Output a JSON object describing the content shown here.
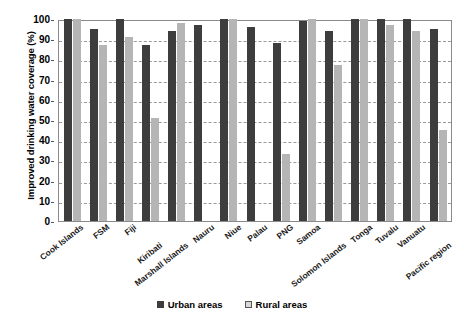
{
  "chart_data": {
    "type": "bar",
    "title": "",
    "xlabel": "",
    "ylabel": "Improved drinking water coverage (%)",
    "ylim": [
      0,
      100
    ],
    "yticks": [
      0,
      10,
      20,
      30,
      40,
      50,
      60,
      70,
      80,
      90,
      100
    ],
    "grid": true,
    "legend_position": "bottom",
    "categories": [
      "Cook Islands",
      "FSM",
      "Fiji",
      "Kiribati",
      "Marshall Islands",
      "Nauru",
      "Niue",
      "Palau",
      "PNG",
      "Samoa",
      "Solomon Islands",
      "Tonga",
      "Tuvalu",
      "Vanuatu",
      "Pacific region"
    ],
    "series": [
      {
        "name": "Urban areas",
        "color": "#3d3d3d",
        "values": [
          100,
          95,
          100,
          87,
          94,
          97,
          100,
          96,
          88,
          99,
          94,
          100,
          100,
          100,
          95
        ]
      },
      {
        "name": "Rural areas",
        "color": "#b5b5b5",
        "values": [
          100,
          87,
          91,
          51,
          98,
          0,
          100,
          0,
          33,
          100,
          77,
          100,
          97,
          94,
          45
        ]
      }
    ]
  },
  "legend": {
    "items": [
      {
        "label": "Urban areas",
        "swatch": "urban"
      },
      {
        "label": "Rural areas",
        "swatch": "rural"
      }
    ]
  }
}
